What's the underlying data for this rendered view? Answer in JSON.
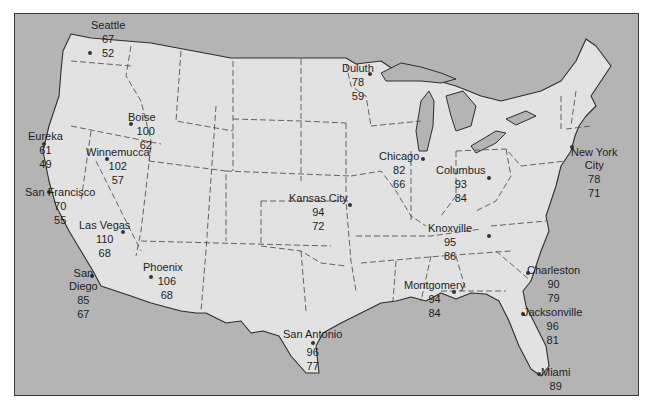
{
  "map": {
    "title": "",
    "colors": {
      "land": "#e2e2e2",
      "water": "#b4b4b4",
      "border": "#2e2e2e",
      "text": "#1e1e1e"
    },
    "legend_note": "each city shows two temperatures: high (top) and low (bottom)",
    "cities": [
      {
        "name": "Seattle",
        "high": "67",
        "low": "52"
      },
      {
        "name": "Boise",
        "high": "100",
        "low": "62"
      },
      {
        "name": "Eureka",
        "high": "61",
        "low": "49"
      },
      {
        "name": "Winnemucca",
        "high": "102",
        "low": "57"
      },
      {
        "name": "San Francisco",
        "high": "70",
        "low": "55"
      },
      {
        "name": "Las Vegas",
        "high": "110",
        "low": "68"
      },
      {
        "name": "San Diego",
        "name_line1": "San",
        "name_line2": "Diego",
        "high": "85",
        "low": "67"
      },
      {
        "name": "Phoenix",
        "high": "106",
        "low": "68"
      },
      {
        "name": "Duluth",
        "high": "78",
        "low": "59"
      },
      {
        "name": "Kansas City",
        "high": "94",
        "low": "72"
      },
      {
        "name": "Chicago",
        "high": "82",
        "low": "66"
      },
      {
        "name": "Columbus",
        "high": "93",
        "low": "84"
      },
      {
        "name": "Knoxville",
        "high": "95",
        "low": "86"
      },
      {
        "name": "New York City",
        "name_line1": "New York",
        "name_line2": "City",
        "high": "78",
        "low": "71"
      },
      {
        "name": "Charleston",
        "high": "90",
        "low": "79"
      },
      {
        "name": "Montgomery",
        "high": "94",
        "low": "84"
      },
      {
        "name": "Jacksonville",
        "high": "96",
        "low": "81"
      },
      {
        "name": "San Antonio",
        "high": "96",
        "low": "77"
      },
      {
        "name": "Miami",
        "high": "89",
        "low": "81"
      }
    ]
  }
}
